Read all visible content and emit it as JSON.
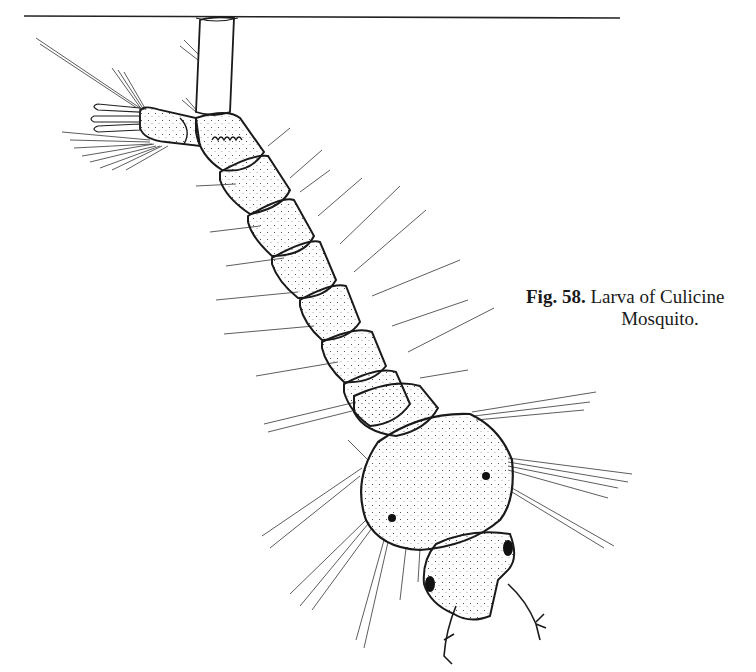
{
  "figure": {
    "label": "Fig. 58.",
    "caption_line1": "Larva of Culicine",
    "caption_line2": "Mosquito.",
    "parts": [
      "water-surface-line",
      "siphon",
      "anal-segment",
      "anal-papillae",
      "abdominal-segments",
      "thorax",
      "head",
      "eyes",
      "antennae",
      "setae"
    ]
  },
  "colors": {
    "ink": "#1a1a1a",
    "paper": "#ffffff"
  }
}
